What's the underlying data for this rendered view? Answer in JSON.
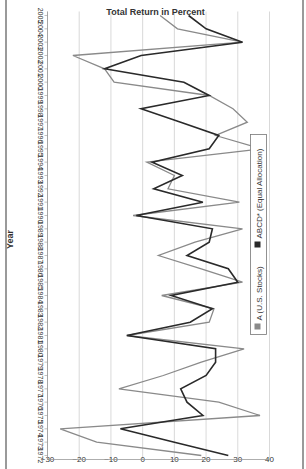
{
  "chart_data": {
    "type": "line",
    "title": "",
    "xlabel": "Year",
    "ylabel": "Total Return in Percent",
    "ylim": [
      -30,
      40
    ],
    "yticks": [
      40,
      30,
      20,
      10,
      0,
      -10,
      -20,
      -30
    ],
    "grid": true,
    "legend_position": "top",
    "orientation_note": "figure rotated 90 degrees",
    "x": [
      1972,
      1973,
      1974,
      1975,
      1976,
      1977,
      1978,
      1979,
      1980,
      1981,
      1982,
      1983,
      1984,
      1985,
      1986,
      1987,
      1988,
      1989,
      1990,
      1991,
      1992,
      1993,
      1994,
      1995,
      1996,
      1997,
      1998,
      1999,
      2000,
      2001,
      2002,
      2003,
      2004,
      2005
    ],
    "series": [
      {
        "name": "A (U.S. Stocks)",
        "color": "#8a8a8a",
        "values": [
          18.5,
          -14.5,
          -26,
          37,
          24,
          -7.5,
          6.5,
          18.5,
          32,
          -5,
          21,
          22.5,
          6,
          31.5,
          18.5,
          5,
          16.5,
          31.5,
          -3,
          30.5,
          8,
          10,
          1.3,
          37.5,
          23,
          33,
          28.5,
          21,
          -9,
          -12,
          -22,
          31.5,
          11,
          5.5
        ]
      },
      {
        "name": "ABCD* (Equal Allocation)",
        "color": "#2a2a2a",
        "values": [
          27,
          10,
          -7,
          19,
          14,
          12,
          20,
          23,
          23,
          -5,
          15,
          22,
          9,
          30,
          27,
          14,
          21,
          22,
          -2,
          19,
          3.5,
          12.5,
          3,
          21,
          24,
          12,
          -0.5,
          21,
          13,
          -12,
          -0.5,
          31.5,
          20,
          14.5
        ]
      }
    ]
  },
  "legend": {
    "a_label": "A (U.S. Stocks)",
    "abcd_label": "ABCD* (Equal Allocation)"
  },
  "axis": {
    "x_title": "Year",
    "y_title": "Total Return in Percent"
  }
}
